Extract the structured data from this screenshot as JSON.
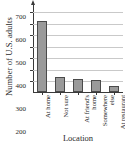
{
  "chart_data": {
    "type": "bar",
    "title": "",
    "xlabel": "Location",
    "ylabel": "Number of U.S. adults",
    "categories": [
      "At home",
      "Not sure",
      "At friend's home",
      "Somewhere else",
      "At restaurant or bar"
    ],
    "category_lines": [
      [
        "At home"
      ],
      [
        "Not sure"
      ],
      [
        "At friend's",
        "home"
      ],
      [
        "Somewhere",
        "else"
      ],
      [
        "At restaurant",
        "or bar"
      ]
    ],
    "values": [
      620,
      130,
      110,
      105,
      50
    ],
    "ylim": [
      0,
      730
    ],
    "yticks": [
      100,
      200,
      300,
      400,
      500,
      600,
      700
    ],
    "ytick_labels": [
      "100",
      "200",
      "300",
      "400",
      "500",
      "600",
      "700"
    ],
    "grid": true,
    "legend": false,
    "bar_color": "#9a9a9a",
    "bar_edge_color": "#4a4a4a",
    "grid_color": "#c9c9c9",
    "axis_color": "#3a3a3a"
  }
}
